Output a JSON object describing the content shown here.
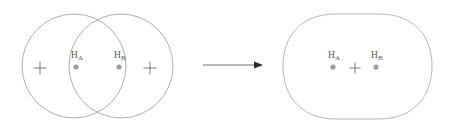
{
  "figure": {
    "background_color": "#ffffff",
    "width": 449,
    "height": 133
  },
  "colors": {
    "orbital_outline": "#8c8c8c",
    "merged_outline": "#9a9a9a",
    "nucleus_dot": "#9d9d9d",
    "plus_sign": "#6b6b6b",
    "arrow": "#2b2b2b",
    "label_text": "#5a5a5a"
  },
  "left_panel": {
    "name": "two-overlapping-atomic-orbitals",
    "orbitals": [
      {
        "id": "orbital-a",
        "cx": 74,
        "cy": 66,
        "r": 52
      },
      {
        "id": "orbital-b",
        "cx": 121,
        "cy": 66,
        "r": 52
      }
    ],
    "atoms": [
      {
        "label_element": "H",
        "label_subscript": "A",
        "label_x": 79,
        "label_y": 57,
        "dot_x": 76,
        "dot_y": 67,
        "dot_r": 2.6
      },
      {
        "label_element": "H",
        "label_subscript": "B",
        "label_x": 115,
        "label_y": 57,
        "dot_x": 119,
        "dot_y": 67,
        "dot_r": 2.6
      }
    ],
    "plus_signs": [
      {
        "id": "plus-left",
        "x": 40,
        "y": 68,
        "size": 7
      },
      {
        "id": "plus-right",
        "x": 150,
        "y": 68,
        "size": 7
      }
    ]
  },
  "arrow": {
    "name": "transformation-arrow",
    "direction": "right",
    "x_start": 203,
    "x_end": 262,
    "y": 65
  },
  "right_panel": {
    "name": "merged-molecular-orbital",
    "shape": "stadium-merged-lobes",
    "bounds": {
      "x_left": 283,
      "x_right": 432,
      "y_top": 14,
      "y_bottom": 119
    },
    "atoms": [
      {
        "label_element": "H",
        "label_subscript": "A",
        "label_x": 334,
        "label_y": 57,
        "dot_x": 333,
        "dot_y": 67,
        "dot_r": 2.6
      },
      {
        "label_element": "H",
        "label_subscript": "B",
        "label_x": 375,
        "label_y": 57,
        "dot_x": 376,
        "dot_y": 67,
        "dot_r": 2.6
      }
    ],
    "plus_signs": [
      {
        "id": "plus-center",
        "x": 355,
        "y": 68,
        "size": 6
      }
    ]
  }
}
